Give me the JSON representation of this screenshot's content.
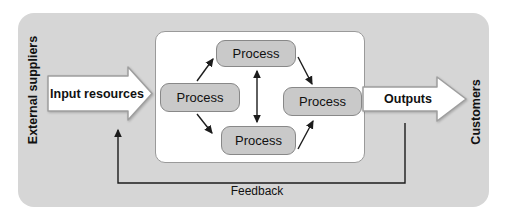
{
  "diagram": {
    "left_label": "External suppliers",
    "right_label": "Customers",
    "input_arrow": {
      "label": "Input resources"
    },
    "output_arrow": {
      "label": "Outputs"
    },
    "feedback": {
      "label": "Feedback"
    },
    "processes": [
      {
        "position": "left",
        "label": "Process"
      },
      {
        "position": "top",
        "label": "Process"
      },
      {
        "position": "right",
        "label": "Process"
      },
      {
        "position": "bottom",
        "label": "Process"
      }
    ],
    "colors": {
      "outer_bg": "#d6d6d6",
      "inner_bg": "#ffffff",
      "inner_border": "#9a9a9a",
      "process_fill": "#c9c9c9",
      "process_border": "#888888",
      "block_arrow_fill": "#ffffff",
      "block_arrow_border": "#9e9e9e",
      "line_color": "#1c1c1c",
      "text_color": "#111111"
    }
  }
}
